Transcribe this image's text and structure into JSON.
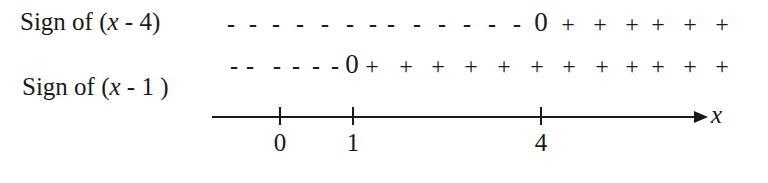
{
  "rows": [
    {
      "label_prefix": "Sign of (",
      "label_var": "x",
      "label_suffix": " - 4)",
      "zero_at": 4,
      "signs": [
        {
          "s": "-",
          "x": 231
        },
        {
          "s": "-",
          "x": 253
        },
        {
          "s": "-",
          "x": 276
        },
        {
          "s": "-",
          "x": 300
        },
        {
          "s": "-",
          "x": 325
        },
        {
          "s": "-",
          "x": 350
        },
        {
          "s": "-",
          "x": 373
        },
        {
          "s": "-",
          "x": 391
        },
        {
          "s": "-",
          "x": 417
        },
        {
          "s": "-",
          "x": 442
        },
        {
          "s": "-",
          "x": 467
        },
        {
          "s": "-",
          "x": 492
        },
        {
          "s": "-",
          "x": 517
        },
        {
          "s": "0",
          "x": 541
        },
        {
          "s": "+",
          "x": 568
        },
        {
          "s": "+",
          "x": 600
        },
        {
          "s": "+",
          "x": 632
        },
        {
          "s": "+",
          "x": 658
        },
        {
          "s": "+",
          "x": 690
        },
        {
          "s": "+",
          "x": 722
        }
      ]
    },
    {
      "label_prefix": "Sign of (",
      "label_var": "x",
      "label_suffix": " - 1 )",
      "zero_at": 1,
      "signs": [
        {
          "s": "-",
          "x": 234
        },
        {
          "s": "-",
          "x": 250
        },
        {
          "s": "-",
          "x": 277
        },
        {
          "s": "-",
          "x": 296
        },
        {
          "s": "-",
          "x": 316
        },
        {
          "s": "-",
          "x": 335
        },
        {
          "s": "0",
          "x": 352
        },
        {
          "s": "+",
          "x": 372
        },
        {
          "s": "+",
          "x": 406
        },
        {
          "s": "+",
          "x": 438
        },
        {
          "s": "+",
          "x": 471
        },
        {
          "s": "+",
          "x": 504
        },
        {
          "s": "+",
          "x": 537
        },
        {
          "s": "+",
          "x": 569
        },
        {
          "s": "+",
          "x": 602
        },
        {
          "s": "+",
          "x": 632
        },
        {
          "s": "+",
          "x": 658
        },
        {
          "s": "+",
          "x": 690
        },
        {
          "s": "+",
          "x": 722
        }
      ]
    }
  ],
  "axis": {
    "variable": "x",
    "ticks": [
      {
        "label": "0",
        "x": 280
      },
      {
        "label": "1",
        "x": 353
      },
      {
        "label": "4",
        "x": 541
      }
    ]
  },
  "colors": {
    "ink": "#1a1a1a",
    "background": "#ffffff"
  }
}
